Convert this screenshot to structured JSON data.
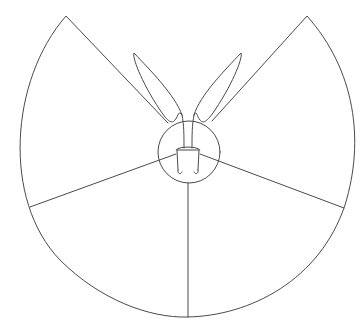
{
  "diagram": {
    "type": "line-drawing",
    "stroke_color": "#4a4a4a",
    "background": "#ffffff",
    "elements": {
      "outer_fan": "sector outline with two straight top edges and a large circular arc",
      "hub_circle": "central circle",
      "dividers": [
        "left-divider",
        "right-divider",
        "bottom-divider"
      ],
      "pot": "small trapezoid pot inside hub",
      "leaves": [
        "left-leaf",
        "right-leaf"
      ]
    }
  }
}
